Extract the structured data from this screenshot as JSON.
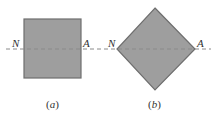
{
  "figure": {
    "colors": {
      "fill": "#9e9e9e",
      "stroke": "#6e6e6e",
      "axis_line": "#8a8a8a",
      "text": "#333333"
    },
    "panel_a": {
      "shape": "square",
      "label_left": "N",
      "label_right": "A",
      "caption_open": "(",
      "caption_letter": "a",
      "caption_close": ")"
    },
    "panel_b": {
      "shape": "diamond",
      "label_left": "N",
      "label_right": "A",
      "caption_open": "(",
      "caption_letter": "b",
      "caption_close": ")"
    },
    "neutral_axis": "dashed horizontal line through both shapes (N–A)"
  }
}
